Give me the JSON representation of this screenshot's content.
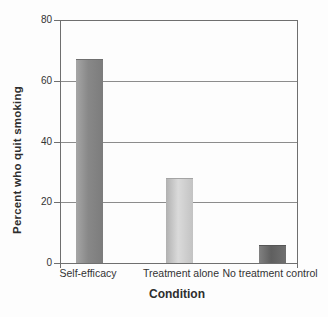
{
  "chart_data": {
    "type": "bar",
    "title": "",
    "categories": [
      "Self-efficacy",
      "Treatment alone",
      "No treatment control"
    ],
    "values": [
      67,
      28,
      6
    ],
    "xlabel": "Condition",
    "ylabel": "Percent who quit smoking",
    "ylim": [
      0,
      80
    ],
    "yticks": [
      0,
      20,
      40,
      60,
      80
    ],
    "grid": "horizontal gridlines at 20, 40, 60",
    "legend": "none",
    "bar_styles": [
      {
        "name": "medium-gray-bar",
        "from": "#a6a6a6",
        "mid": "#888888",
        "to": "#7c7c7c",
        "top_edge": "#6f6f6f"
      },
      {
        "name": "light-gray-bar",
        "from": "#b1b1b1",
        "mid": "#dadada",
        "to": "#c3c3c3",
        "top_edge": "#a4a4a4"
      },
      {
        "name": "dark-gray-bar",
        "from": "#818181",
        "mid": "#5f5f5f",
        "to": "#707070",
        "top_edge": "#565656"
      }
    ],
    "colors": {
      "axis": "#6f6f6f",
      "grid": "#8c8c8c",
      "text": "#333333",
      "background": "#fdfdfd"
    }
  }
}
